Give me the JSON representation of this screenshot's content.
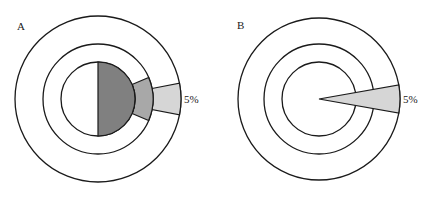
{
  "panels": [
    {
      "label": "A",
      "annotation": "5%",
      "center": [
        98,
        99
      ],
      "radii": {
        "inner": 37,
        "middle": 55,
        "outer": 83
      },
      "segments": {
        "inner_half": {
          "fill": "#808080",
          "span_deg": 180
        },
        "middle_wedge": {
          "fill": "#a8a8a8",
          "half_angle_deg": 23
        },
        "outer_wedge": {
          "fill": "#d6d6d6",
          "half_angle_deg": 11
        }
      }
    },
    {
      "label": "B",
      "annotation": "5%",
      "center": [
        319,
        99
      ],
      "radii": {
        "inner": 37,
        "middle": 55,
        "outer": 81
      },
      "segments": {
        "wedge": {
          "fill": "#d6d6d6",
          "half_angle_deg": 10
        }
      }
    }
  ],
  "colors": {
    "stroke": "#1a1a1a",
    "background": "#ffffff"
  }
}
